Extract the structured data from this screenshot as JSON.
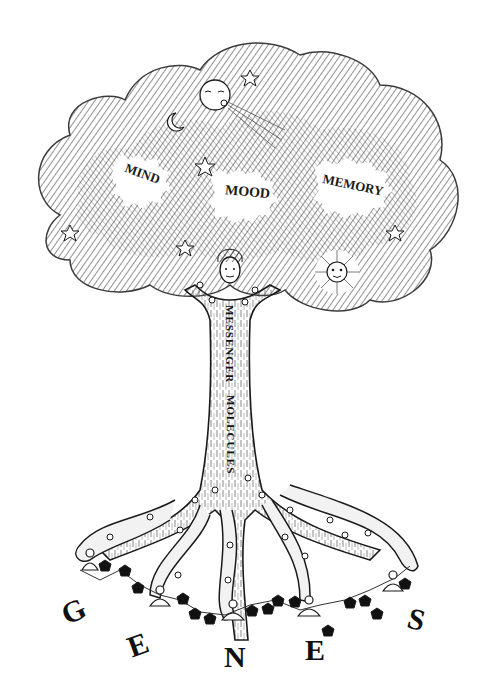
{
  "figure": {
    "canopy_labels": [
      {
        "text": "MIND",
        "x": 148,
        "y": 176,
        "rotate": 20,
        "size": 13
      },
      {
        "text": "MOOD",
        "x": 246,
        "y": 192,
        "rotate": 5,
        "size": 14
      },
      {
        "text": "MEMORY",
        "x": 356,
        "y": 186,
        "rotate": 10,
        "size": 13
      }
    ],
    "trunk_label_1": "MESSENGER",
    "trunk_label_2": "MOLECULES",
    "genes_letters": [
      {
        "text": "G",
        "x": 72,
        "y": 612,
        "rotate": -25
      },
      {
        "text": "E",
        "x": 138,
        "y": 645,
        "rotate": -20
      },
      {
        "text": "N",
        "x": 235,
        "y": 657,
        "rotate": 0
      },
      {
        "text": "E",
        "x": 315,
        "y": 651,
        "rotate": 0
      },
      {
        "text": "S",
        "x": 418,
        "y": 620,
        "rotate": 15
      }
    ],
    "figures": {
      "wind_face": "wind-blowing-face",
      "moon": "crescent-moon",
      "sun": "sun-face",
      "trunk_figure": "human-figure-holding-canopy",
      "meditators": [
        "meditating-figure-1",
        "meditating-figure-2",
        "meditating-figure-3",
        "meditating-figure-4",
        "meditating-figure-5"
      ]
    },
    "colors": {
      "ink": "#1a1a1a",
      "paper": "#ffffff",
      "bark": "#e8e8e8"
    }
  }
}
